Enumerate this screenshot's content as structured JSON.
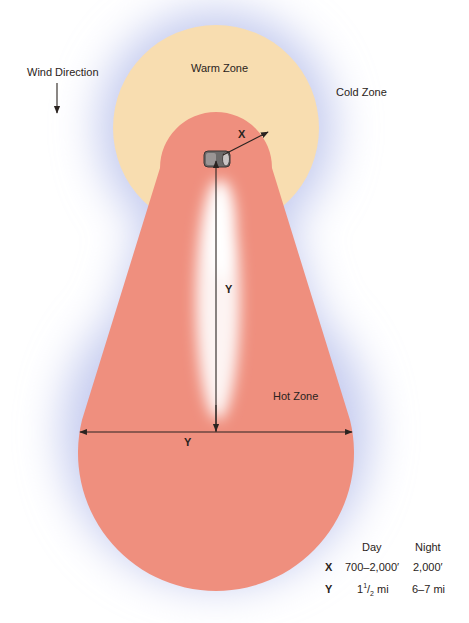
{
  "figure": {
    "labels": {
      "wind_direction": "Wind Direction",
      "warm_zone": "Warm Zone",
      "cold_zone": "Cold Zone",
      "hot_zone": "Hot Zone",
      "x_marker": "X",
      "y_vertical_marker": "Y",
      "y_horizontal_marker": "Y"
    },
    "colors": {
      "cold_halo": "#c9cff0",
      "warm_zone": "#f8ddb0",
      "hot_zone": "#ef8f7e",
      "plume": "#fbeeee",
      "arrow": "#2a2320"
    },
    "distance_table": {
      "headers": [
        "",
        "Day",
        "Night"
      ],
      "rows": [
        {
          "key": "X",
          "day": "700–2,000′",
          "night": "2,000′"
        },
        {
          "key": "Y",
          "day_whole": "1",
          "day_num": "1",
          "day_den": "2",
          "day_unit": " mi",
          "night": "6–7 mi"
        }
      ]
    }
  }
}
